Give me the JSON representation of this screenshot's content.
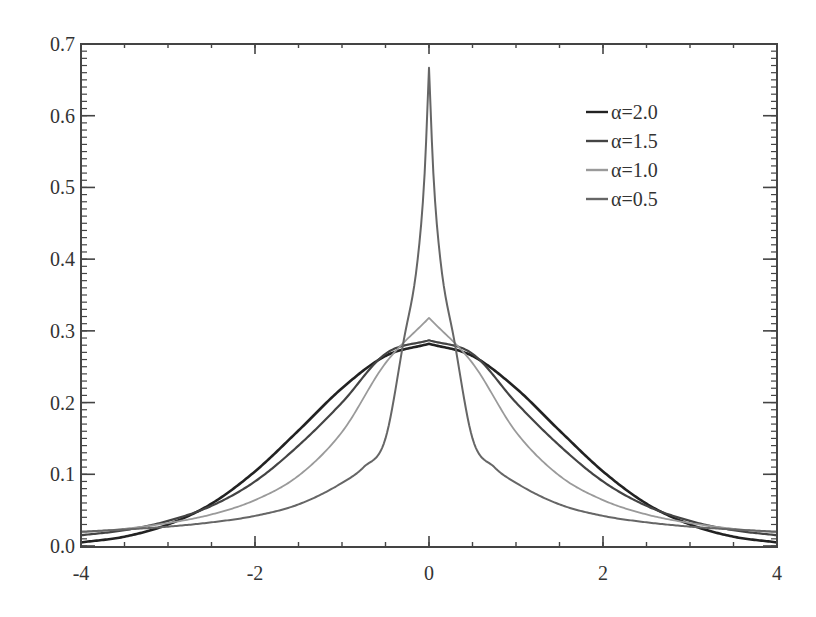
{
  "chart_data": {
    "type": "line",
    "title": "",
    "xlabel": "",
    "ylabel": "",
    "xlim": [
      -4,
      4
    ],
    "ylim": [
      0.0,
      0.7
    ],
    "grid": false,
    "legend_position": "upper right",
    "x_ticks": [
      -4,
      -2,
      0,
      2,
      4
    ],
    "x_tick_labels": [
      "-4",
      "-2",
      "0",
      "2",
      "4"
    ],
    "x_minor_step": 0.5,
    "y_ticks": [
      0.0,
      0.1,
      0.2,
      0.3,
      0.4,
      0.5,
      0.6,
      0.7
    ],
    "y_tick_labels": [
      "0.0",
      "0.1",
      "0.2",
      "0.3",
      "0.4",
      "0.5",
      "0.6",
      "0.7"
    ],
    "y_minor_step": 0.01,
    "symmetric_about_zero": true,
    "series": [
      {
        "name": "α=2.0",
        "color": "#222222",
        "width": 2.6,
        "x": [
          0,
          0.5,
          1,
          1.5,
          2,
          2.5,
          3,
          3.5,
          4
        ],
        "values": [
          0.282,
          0.265,
          0.22,
          0.161,
          0.104,
          0.059,
          0.03,
          0.013,
          0.005
        ]
      },
      {
        "name": "α=1.5",
        "color": "#444444",
        "width": 2.2,
        "x": [
          0,
          0.5,
          1,
          1.5,
          2,
          2.5,
          3,
          3.5,
          4
        ],
        "values": [
          0.287,
          0.268,
          0.2,
          0.14,
          0.09,
          0.056,
          0.035,
          0.022,
          0.015
        ]
      },
      {
        "name": "α=1.0",
        "color": "#9a9a9a",
        "width": 1.8,
        "x": [
          0,
          0.5,
          1,
          1.5,
          2,
          2.5,
          3,
          3.5,
          4
        ],
        "values": [
          0.318,
          0.255,
          0.159,
          0.098,
          0.064,
          0.044,
          0.032,
          0.024,
          0.019
        ]
      },
      {
        "name": "α=0.5",
        "color": "#666666",
        "width": 2.0,
        "x": [
          0,
          0.05,
          0.13,
          0.29,
          0.5,
          0.75,
          1,
          1.5,
          2,
          2.5,
          3,
          3.5,
          4
        ],
        "values": [
          0.667,
          0.52,
          0.4,
          0.287,
          0.15,
          0.11,
          0.088,
          0.058,
          0.042,
          0.033,
          0.027,
          0.023,
          0.02
        ]
      }
    ]
  },
  "legend": {
    "items": [
      {
        "label": "α=2.0",
        "color": "#222222"
      },
      {
        "label": "α=1.5",
        "color": "#444444"
      },
      {
        "label": "α=1.0",
        "color": "#9a9a9a"
      },
      {
        "label": "α=0.5",
        "color": "#666666"
      }
    ]
  },
  "style": {
    "axis_color": "#444444",
    "background": "#ffffff"
  }
}
